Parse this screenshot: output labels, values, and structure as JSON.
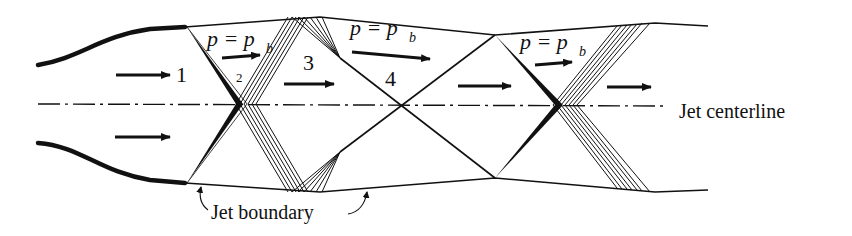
{
  "diagram": {
    "type": "underexpanded-jet-shock-diamond",
    "colors": {
      "ink": "#111111",
      "background": "#ffffff"
    },
    "region_labels": [
      {
        "id": "1",
        "text": "1",
        "x": 176,
        "y": 82,
        "size": 22
      },
      {
        "id": "2",
        "text": "2",
        "x": 236,
        "y": 82,
        "size": 13
      },
      {
        "id": "3",
        "text": "3",
        "x": 305,
        "y": 70,
        "size": 22
      },
      {
        "id": "4",
        "text": "4",
        "x": 385,
        "y": 86,
        "size": 22
      }
    ],
    "pressure_labels": [
      {
        "main": "p = p",
        "sub": "b",
        "x": 205,
        "y": 46
      },
      {
        "main": "p = p",
        "sub": "b",
        "x": 350,
        "y": 35
      },
      {
        "main": "p = p",
        "sub": "b",
        "x": 520,
        "y": 49
      }
    ],
    "centerline_label": "Jet centerline",
    "boundary_label": "Jet boundary"
  }
}
